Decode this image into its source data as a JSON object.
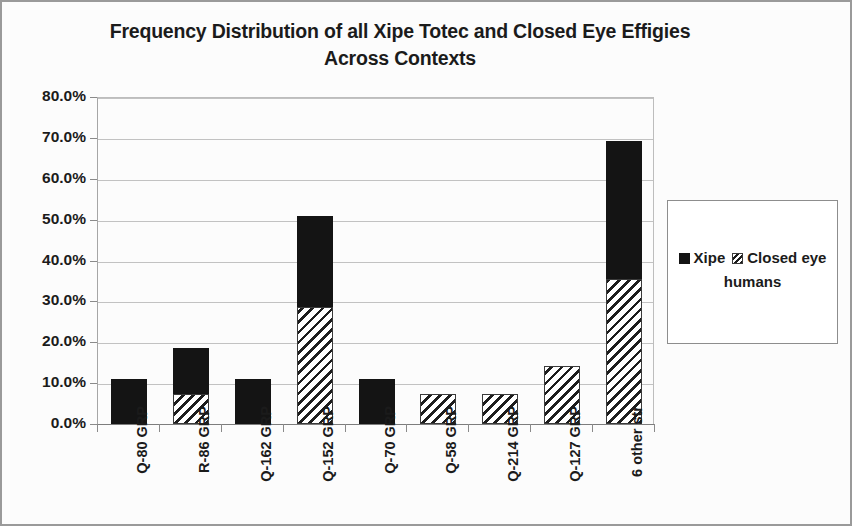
{
  "chart_data": {
    "type": "bar",
    "subtype": "stacked-column",
    "title": "Frequency Distribution of all Xipe Totec and Closed Eye Effigies Across Contexts",
    "title_lines": [
      "Frequency Distribution of all Xipe Totec and Closed Eye Effigies",
      "Across Contexts"
    ],
    "xlabel": "",
    "ylabel": "",
    "ylim": [
      0,
      80
    ],
    "ytick_labels": [
      "0.0%",
      "10.0%",
      "20.0%",
      "30.0%",
      "40.0%",
      "50.0%",
      "60.0%",
      "70.0%",
      "80.0%"
    ],
    "ytick_values": [
      0,
      10,
      20,
      30,
      40,
      50,
      60,
      70,
      80
    ],
    "grid": true,
    "grid_axis": "y",
    "legend_position": "right",
    "categories": [
      "Q-80 GRP",
      "R-86 GRP",
      "Q-162 GRP",
      "Q-152 GRP",
      "Q-70 GRP",
      "Q-58 GRP",
      "Q-214 GRP",
      "Q-127 GRP",
      "6 other str"
    ],
    "series": [
      {
        "name": "Closed eye humans",
        "fill": "diagonal-hatch",
        "color": "#1d1d1d",
        "stack_order": 0,
        "values": [
          0.0,
          7.4,
          0.0,
          28.7,
          0.0,
          7.4,
          7.4,
          14.2,
          35.6
        ]
      },
      {
        "name": "Xipe",
        "fill": "solid",
        "color": "#141414",
        "stack_order": 1,
        "values": [
          11.1,
          11.1,
          11.1,
          22.2,
          11.1,
          0.0,
          0.0,
          0.0,
          33.6
        ]
      }
    ],
    "totals": [
      11.1,
      18.5,
      11.1,
      50.9,
      11.1,
      7.4,
      7.4,
      14.2,
      69.2
    ]
  },
  "legend": {
    "entries": [
      {
        "label": "Xipe",
        "swatch": "solid-black-square"
      },
      {
        "label": "Closed eye humans",
        "swatch": "diagonal-hatch-square"
      }
    ]
  }
}
